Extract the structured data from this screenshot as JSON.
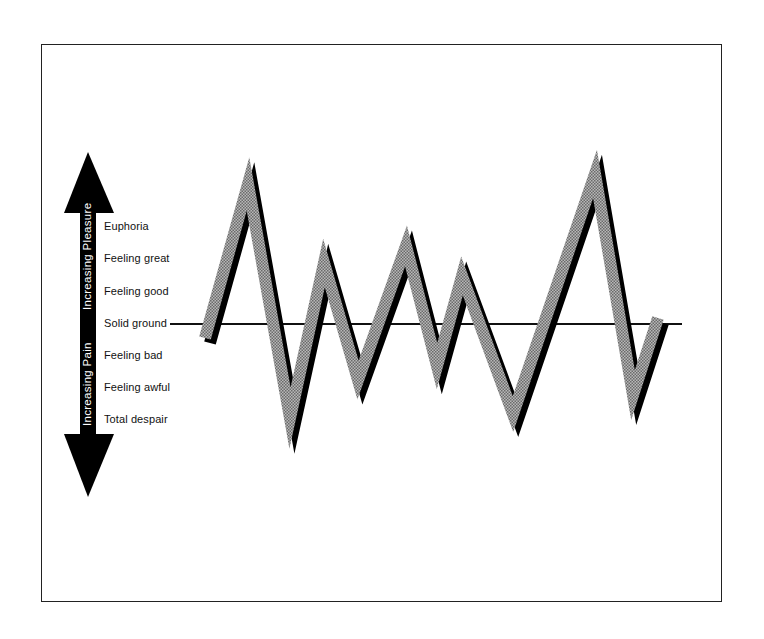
{
  "diagram": {
    "type": "mood-swing-diagram",
    "axis": {
      "up_label": "Increasing Pleasure",
      "down_label": "Increasing Pain"
    },
    "scale_labels": [
      "Euphoria",
      "Feeling great",
      "Feeling good",
      "Solid ground",
      "Feeling bad",
      "Feeling awful",
      "Total despair"
    ],
    "baseline_label": "Solid ground",
    "colors": {
      "band_fill": "#9a9a9a",
      "band_shadow": "#000000",
      "baseline": "#111111",
      "arrow": "#000000",
      "frame": "#222222"
    },
    "mood_path": [
      {
        "x": 205,
        "y": 338,
        "level": "Feeling bad (slightly below solid ground)"
      },
      {
        "x": 248,
        "y": 184,
        "level": "above Euphoria"
      },
      {
        "x": 290,
        "y": 418,
        "level": "Total despair"
      },
      {
        "x": 324,
        "y": 263,
        "level": "Feeling great"
      },
      {
        "x": 358,
        "y": 380,
        "level": "Feeling awful"
      },
      {
        "x": 406,
        "y": 246,
        "level": "between Euphoria and Feeling great"
      },
      {
        "x": 437,
        "y": 366,
        "level": "Feeling bad/Feeling awful"
      },
      {
        "x": 462,
        "y": 276,
        "level": "Feeling great/Feeling good"
      },
      {
        "x": 513,
        "y": 414,
        "level": "Total despair"
      },
      {
        "x": 595,
        "y": 174,
        "level": "above Euphoria"
      },
      {
        "x": 633,
        "y": 395,
        "level": "Feeling awful/Total despair"
      },
      {
        "x": 658,
        "y": 318,
        "level": "Solid ground"
      }
    ]
  }
}
